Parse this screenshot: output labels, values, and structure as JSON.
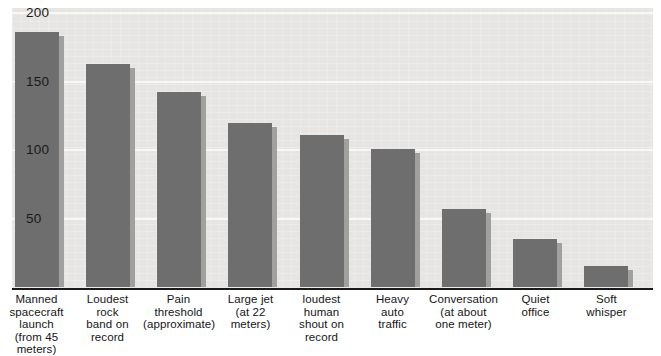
{
  "chart_data": {
    "type": "bar",
    "title": "",
    "subtitle": "",
    "xlabel": "",
    "ylabel": "",
    "ylim": [
      0,
      200
    ],
    "yticks": [
      50,
      100,
      150,
      200
    ],
    "ytick_labels": [
      "50",
      "100",
      "150",
      "200"
    ],
    "grid": "horizontal",
    "legend": "none",
    "orientation": "vertical",
    "bar_color": "#6f6e6e",
    "bar_shadow_color": "#a0a09e",
    "plot_background": "#e6e5e3",
    "gridline_color": "#f7f7f5",
    "axis_color": "#1a1a1a",
    "categories": [
      "Manned spacecraft launch (from 45 meters)",
      "Loudest rock band on record",
      "Pain threshold (approximate)",
      "Large jet (at 22 meters)",
      "loudest human shout on record",
      "Heavy auto traffic",
      "Conversation (at about one meter)",
      "Quiet office",
      "Soft whisper"
    ],
    "category_lines": [
      [
        "Manned",
        "spacecraft",
        "launch",
        "(from 45",
        "meters)"
      ],
      [
        "Loudest",
        "rock",
        "band on",
        "record"
      ],
      [
        "Pain",
        "threshold",
        "(approximate)"
      ],
      [
        "Large jet",
        "(at 22",
        "meters)"
      ],
      [
        "loudest",
        "human",
        "shout on",
        "record"
      ],
      [
        "Heavy",
        "auto",
        "traffic"
      ],
      [
        "Conversation",
        "(at about",
        "one meter)"
      ],
      [
        "Quiet",
        "office"
      ],
      [
        "Soft",
        "whisper"
      ]
    ],
    "values": [
      186,
      163,
      142,
      120,
      111,
      101,
      57,
      35,
      15
    ]
  }
}
